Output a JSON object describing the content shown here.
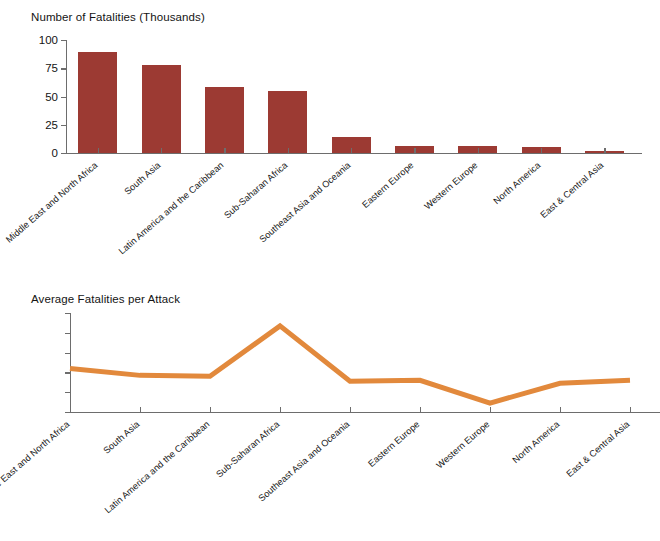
{
  "page": {
    "background": "#ffffff",
    "bar_color": "#9c3a33",
    "line_color": "#e2893c",
    "axis_color": "#6d6d6d"
  },
  "charts": {
    "top": {
      "title": "Number of Fatalities (Thousands)"
    },
    "bottom": {
      "title": "Average Fatalities per Attack"
    }
  },
  "chart_data": [
    {
      "type": "bar",
      "title": "Number of Fatalities (Thousands)",
      "xlabel": "",
      "ylabel": "",
      "ylim": [
        0,
        100
      ],
      "yticks": [
        0,
        25,
        50,
        75,
        100
      ],
      "ytick_labels": [
        "0",
        "25",
        "50",
        "75",
        "100"
      ],
      "grid": false,
      "legend": "none",
      "color": "#9c3a33",
      "categories": [
        "Middle East and North Africa",
        "South Asia",
        "Latin America and the Caribbean",
        "Sub-Saharan Africa",
        "Southeast Asia and Oceania",
        "Eastern Europe",
        "Western Europe",
        "North America",
        "East & Central Asia"
      ],
      "values": [
        89,
        78,
        58,
        55,
        14,
        6.5,
        6.5,
        5,
        2
      ]
    },
    {
      "type": "line",
      "title": "Average Fatalities per Attack",
      "xlabel": "",
      "ylabel": "",
      "ylim": [
        0,
        5
      ],
      "yticks": [
        0,
        1,
        2,
        3,
        4,
        5
      ],
      "ytick_labels": [
        "",
        "",
        "",
        "",
        "",
        ""
      ],
      "grid": false,
      "legend": "none",
      "color": "#e2893c",
      "categories": [
        "Middle East and North Africa",
        "South Asia",
        "Latin America and the Caribbean",
        "Sub-Saharan Africa",
        "Southeast Asia and Oceania",
        "Eastern Europe",
        "Western Europe",
        "North America",
        "East & Central Asia"
      ],
      "values": [
        2.2,
        1.85,
        1.8,
        4.35,
        1.55,
        1.6,
        0.45,
        1.45,
        1.6
      ]
    }
  ]
}
